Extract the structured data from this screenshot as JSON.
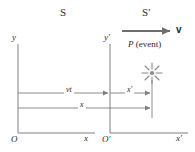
{
  "diagram": {
    "type": "reference-frames-lorentz-transformation",
    "colors": {
      "line": "#808080",
      "text": "#2b2b2b",
      "velocity_arrow": "#6e6e6e",
      "burst": "#8a8a8a",
      "background": "#ffffff"
    },
    "frames": [
      {
        "id": "S",
        "label": "S",
        "x": 63,
        "y": 13
      },
      {
        "id": "Sp",
        "label": "S′",
        "x": 145,
        "y": 13
      }
    ],
    "axes": [
      {
        "id": "y",
        "label": "y",
        "label_x": 14,
        "label_y": 38,
        "orientation": "vertical",
        "x": 18,
        "y1": 44,
        "y2": 133
      },
      {
        "id": "x",
        "label": "x",
        "label_x": 86,
        "label_y": 138,
        "orientation": "horizontal",
        "y": 133,
        "x1": 18,
        "x2": 95
      },
      {
        "id": "yp",
        "label": "y′",
        "label_x": 106,
        "label_y": 38,
        "orientation": "vertical",
        "x": 110,
        "y1": 44,
        "y2": 133
      },
      {
        "id": "xp",
        "label": "x′",
        "label_x": 178,
        "label_y": 138,
        "orientation": "horizontal",
        "y": 133,
        "x1": 110,
        "x2": 188
      }
    ],
    "origins": [
      {
        "id": "O",
        "label": "O",
        "x": 12,
        "y": 139
      },
      {
        "id": "Op",
        "label": "O′",
        "x": 104,
        "y": 139
      }
    ],
    "velocity": {
      "label": "v",
      "label_x": 178,
      "label_y": 26,
      "arrow_x1": 122,
      "arrow_x2": 172,
      "arrow_y": 31
    },
    "event": {
      "label_plain": "P (event)",
      "label_symbol": "P",
      "label_text": " (event)",
      "label_x": 130,
      "label_y": 44,
      "burst_cx": 152,
      "burst_cy": 73,
      "burst_rays": 8,
      "burst_radius": 10
    },
    "measurements": [
      {
        "id": "vt",
        "label": "vt",
        "label_x": 66,
        "label_y": 88,
        "from_x": 18,
        "to_x": 110,
        "y": 93,
        "description": "distance O to O-prime"
      },
      {
        "id": "xprime",
        "label": "x′",
        "label_x": 126,
        "label_y": 88,
        "from_x": 110,
        "to_x": 152,
        "y": 93,
        "description": "position of event in S-prime frame"
      },
      {
        "id": "x",
        "label": "x",
        "label_x": 79,
        "label_y": 103,
        "from_x": 18,
        "to_x": 152,
        "y": 108,
        "description": "position of event in S frame"
      }
    ],
    "event_drop_line": {
      "x": 152,
      "y1": 80,
      "y2": 116
    }
  }
}
